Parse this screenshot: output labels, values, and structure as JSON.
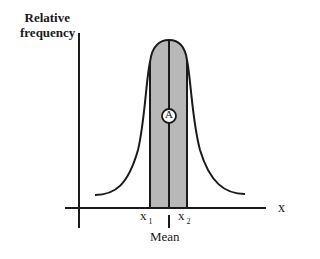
{
  "diagram": {
    "type": "normal-distribution",
    "y_axis_label_line1": "Relative",
    "y_axis_label_line2": "frequency",
    "x_axis_label": "x",
    "x1_label": "x",
    "x1_subscript": "1",
    "x2_label": "x",
    "x2_subscript": "2",
    "mean_label": "Mean",
    "region_label": "A",
    "colors": {
      "line": "#1a1a1a",
      "shaded_region": "#b8b8b8",
      "background": "#ffffff"
    }
  }
}
